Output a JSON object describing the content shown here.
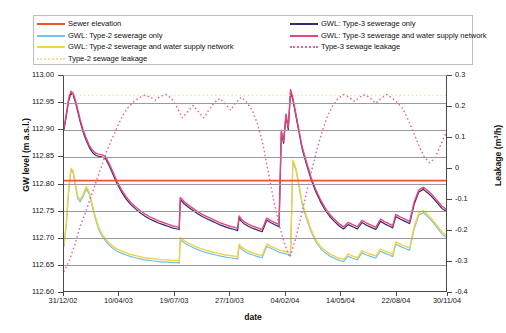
{
  "legend": {
    "items": [
      {
        "label": "Sewer elevation",
        "color": "#E8562A",
        "style": "solid",
        "column": "left"
      },
      {
        "label": "GWL: Type-2 sewerage only",
        "color": "#6FC3EC",
        "style": "solid",
        "column": "left"
      },
      {
        "label": "GWL: Type-2 sewerage and water supply network",
        "color": "#F5D33F",
        "style": "solid",
        "column": "left"
      },
      {
        "label": "Type-2 sewage leakage",
        "color": "#F2E2A0",
        "style": "dotted",
        "column": "left"
      },
      {
        "label": "GWL: Type-3 sewerage only",
        "color": "#2B2B6E",
        "style": "solid",
        "column": "right"
      },
      {
        "label": "GWL: Type-3 sewerage and water supply network",
        "color": "#E8457B",
        "style": "solid",
        "column": "right"
      },
      {
        "label": "Type-3 sewage leakage",
        "color": "#E8629B",
        "style": "dotted",
        "column": "right"
      }
    ]
  },
  "chart_data": {
    "type": "line",
    "title": "",
    "xlabel": "date",
    "ylabel": "GW level (m a.s.l.)",
    "y2label": "Leakage (m³/h)",
    "grid": true,
    "legend_position": "top",
    "x_tick_labels": [
      "31/12/02",
      "10/04/03",
      "19/07/03",
      "27/10/03",
      "04/02/04",
      "14/05/04",
      "22/08/04",
      "30/11/04"
    ],
    "x_tick_fractions": [
      0.0,
      0.1445,
      0.289,
      0.4335,
      0.578,
      0.7225,
      0.867,
      1.0
    ],
    "ylim": [
      112.6,
      113.0
    ],
    "y_tick_labels": [
      "113.00",
      "112.95",
      "112.90",
      "112.85",
      "112.80",
      "112.75",
      "112.70",
      "112.65",
      "112.60"
    ],
    "y_tick_values": [
      113.0,
      112.95,
      112.9,
      112.85,
      112.8,
      112.75,
      112.7,
      112.65,
      112.6
    ],
    "y2lim": [
      -0.4,
      0.3
    ],
    "y2_tick_labels": [
      "0.3",
      "0.2",
      "0.1",
      "0",
      "-0.1",
      "-0.2",
      "-0.3",
      "-0.4"
    ],
    "y2_tick_values": [
      0.3,
      0.2,
      0.1,
      0.0,
      -0.1,
      -0.2,
      -0.3,
      -0.4
    ],
    "series": [
      {
        "name": "Sewer elevation",
        "axis": "left",
        "color": "#E8562A",
        "style": "solid",
        "width": 1.8,
        "x": [
          0,
          1
        ],
        "values": [
          112.807,
          112.807
        ]
      },
      {
        "name": "GWL: Type-3 sewerage and water supply network",
        "axis": "left",
        "color": "#E8457B",
        "style": "solid",
        "width": 1.4,
        "x": [
          0.0,
          0.006,
          0.012,
          0.018,
          0.024,
          0.03,
          0.036,
          0.042,
          0.05,
          0.058,
          0.066,
          0.074,
          0.082,
          0.09,
          0.098,
          0.108,
          0.118,
          0.128,
          0.138,
          0.15,
          0.162,
          0.174,
          0.186,
          0.198,
          0.21,
          0.222,
          0.234,
          0.246,
          0.258,
          0.27,
          0.282,
          0.294,
          0.3,
          0.303,
          0.312,
          0.324,
          0.336,
          0.348,
          0.36,
          0.372,
          0.384,
          0.396,
          0.408,
          0.42,
          0.432,
          0.444,
          0.452,
          0.456,
          0.462,
          0.47,
          0.48,
          0.492,
          0.504,
          0.516,
          0.528,
          0.54,
          0.552,
          0.56,
          0.566,
          0.572,
          0.578,
          0.584,
          0.59,
          0.596,
          0.604,
          0.612,
          0.62,
          0.632,
          0.644,
          0.656,
          0.668,
          0.68,
          0.692,
          0.704,
          0.716,
          0.728,
          0.74,
          0.752,
          0.764,
          0.776,
          0.788,
          0.8,
          0.812,
          0.824,
          0.836,
          0.848,
          0.856,
          0.864,
          0.876,
          0.888,
          0.9,
          0.912,
          0.924,
          0.936,
          0.948,
          0.96,
          0.972,
          0.984,
          1.0
        ],
        "values": [
          112.905,
          112.93,
          112.958,
          112.972,
          112.968,
          112.955,
          112.938,
          112.92,
          112.9,
          112.885,
          112.872,
          112.863,
          112.858,
          112.856,
          112.855,
          112.852,
          112.838,
          112.822,
          112.806,
          112.79,
          112.777,
          112.767,
          112.759,
          112.752,
          112.746,
          112.741,
          112.737,
          112.733,
          112.73,
          112.727,
          112.724,
          112.722,
          112.721,
          112.776,
          112.769,
          112.762,
          112.756,
          112.75,
          112.745,
          112.741,
          112.737,
          112.733,
          112.729,
          112.726,
          112.723,
          112.721,
          112.719,
          112.742,
          112.736,
          112.731,
          112.727,
          112.723,
          112.72,
          112.717,
          112.738,
          112.733,
          112.729,
          112.726,
          112.9,
          112.88,
          112.93,
          112.905,
          112.975,
          112.96,
          112.93,
          112.9,
          112.87,
          112.84,
          112.812,
          112.79,
          112.772,
          112.757,
          112.745,
          112.736,
          112.728,
          112.722,
          112.73,
          112.726,
          112.722,
          112.734,
          112.729,
          112.725,
          112.721,
          112.736,
          112.731,
          112.727,
          112.724,
          112.745,
          112.74,
          112.736,
          112.732,
          112.768,
          112.79,
          112.795,
          112.788,
          112.78,
          112.77,
          112.76,
          112.752
        ]
      },
      {
        "name": "GWL: Type-3 sewerage only",
        "axis": "left",
        "color": "#2B2B6E",
        "style": "solid",
        "width": 1.2,
        "note": "nearly coincident with Type-3 with water supply network, drawn 0.002 m lower"
      },
      {
        "name": "GWL: Type-2 sewerage and water supply network",
        "axis": "left",
        "color": "#F5D33F",
        "style": "solid",
        "width": 1.4,
        "x": [
          0.0,
          0.006,
          0.012,
          0.018,
          0.024,
          0.03,
          0.036,
          0.042,
          0.05,
          0.058,
          0.066,
          0.074,
          0.082,
          0.09,
          0.098,
          0.108,
          0.118,
          0.128,
          0.138,
          0.15,
          0.162,
          0.174,
          0.186,
          0.198,
          0.21,
          0.222,
          0.234,
          0.246,
          0.258,
          0.27,
          0.282,
          0.294,
          0.3,
          0.303,
          0.312,
          0.324,
          0.336,
          0.348,
          0.36,
          0.372,
          0.384,
          0.396,
          0.408,
          0.42,
          0.432,
          0.444,
          0.452,
          0.456,
          0.462,
          0.47,
          0.48,
          0.492,
          0.504,
          0.516,
          0.528,
          0.54,
          0.552,
          0.56,
          0.566,
          0.572,
          0.578,
          0.584,
          0.59,
          0.596,
          0.604,
          0.612,
          0.62,
          0.632,
          0.644,
          0.656,
          0.668,
          0.68,
          0.692,
          0.704,
          0.716,
          0.728,
          0.74,
          0.752,
          0.764,
          0.776,
          0.788,
          0.8,
          0.812,
          0.824,
          0.836,
          0.848,
          0.856,
          0.864,
          0.876,
          0.888,
          0.9,
          0.912,
          0.924,
          0.936,
          0.948,
          0.96,
          0.972,
          0.984,
          1.0
        ],
        "values": [
          112.69,
          112.73,
          112.79,
          112.83,
          112.825,
          112.8,
          112.778,
          112.772,
          112.782,
          112.796,
          112.786,
          112.762,
          112.74,
          112.722,
          112.71,
          112.7,
          112.692,
          112.686,
          112.681,
          112.677,
          112.674,
          112.671,
          112.669,
          112.667,
          112.665,
          112.664,
          112.663,
          112.662,
          112.661,
          112.661,
          112.66,
          112.66,
          112.659,
          112.702,
          112.697,
          112.692,
          112.688,
          112.684,
          112.681,
          112.678,
          112.676,
          112.674,
          112.672,
          112.67,
          112.669,
          112.668,
          112.667,
          112.69,
          112.685,
          112.681,
          112.677,
          112.674,
          112.671,
          112.669,
          112.69,
          112.686,
          112.682,
          112.679,
          112.678,
          112.677,
          112.676,
          112.675,
          112.674,
          112.845,
          112.83,
          112.8,
          112.768,
          112.74,
          112.716,
          112.698,
          112.686,
          112.678,
          112.672,
          112.668,
          112.664,
          112.662,
          112.672,
          112.668,
          112.665,
          112.678,
          112.674,
          112.671,
          112.668,
          112.681,
          112.677,
          112.674,
          112.671,
          112.694,
          112.69,
          112.686,
          112.683,
          112.722,
          112.748,
          112.752,
          112.744,
          112.735,
          112.724,
          112.713,
          112.704
        ]
      },
      {
        "name": "GWL: Type-2 sewerage only",
        "axis": "left",
        "color": "#6FC3EC",
        "style": "solid",
        "width": 1.2,
        "note": "nearly coincident with Type-2 with water supply network, drawn 0.004 m lower"
      },
      {
        "name": "Type-2 sewage leakage",
        "axis": "right",
        "color": "#F2E2A0",
        "style": "dotted",
        "width": 1.6,
        "x": [
          0,
          1
        ],
        "values": [
          0.238,
          0.238
        ]
      },
      {
        "name": "Type-3 sewage leakage",
        "axis": "right",
        "color": "#E8629B",
        "style": "dotted",
        "width": 1.6,
        "x": [
          0.0,
          0.014,
          0.028,
          0.042,
          0.056,
          0.07,
          0.084,
          0.098,
          0.112,
          0.126,
          0.14,
          0.154,
          0.168,
          0.182,
          0.196,
          0.21,
          0.224,
          0.238,
          0.252,
          0.266,
          0.28,
          0.294,
          0.308,
          0.322,
          0.336,
          0.35,
          0.364,
          0.378,
          0.392,
          0.406,
          0.42,
          0.434,
          0.448,
          0.462,
          0.476,
          0.49,
          0.504,
          0.518,
          0.532,
          0.546,
          0.56,
          0.574,
          0.588,
          0.602,
          0.616,
          0.63,
          0.644,
          0.658,
          0.672,
          0.686,
          0.7,
          0.714,
          0.728,
          0.742,
          0.756,
          0.77,
          0.784,
          0.798,
          0.812,
          0.826,
          0.84,
          0.854,
          0.868,
          0.882,
          0.896,
          0.91,
          0.924,
          0.938,
          0.952,
          0.966,
          0.98,
          1.0
        ],
        "values": [
          -0.33,
          -0.295,
          -0.245,
          -0.185,
          -0.14,
          -0.09,
          -0.04,
          0.01,
          0.06,
          0.1,
          0.14,
          0.175,
          0.2,
          0.218,
          0.23,
          0.238,
          0.232,
          0.222,
          0.235,
          0.24,
          0.228,
          0.2,
          0.165,
          0.185,
          0.205,
          0.185,
          0.165,
          0.192,
          0.215,
          0.228,
          0.21,
          0.19,
          0.215,
          0.232,
          0.215,
          0.19,
          0.145,
          0.08,
          -0.01,
          -0.1,
          -0.18,
          -0.24,
          -0.285,
          -0.23,
          -0.16,
          -0.085,
          -0.01,
          0.06,
          0.12,
          0.17,
          0.205,
          0.228,
          0.24,
          0.232,
          0.218,
          0.232,
          0.24,
          0.228,
          0.212,
          0.228,
          0.24,
          0.23,
          0.215,
          0.195,
          0.16,
          0.12,
          0.075,
          0.04,
          0.02,
          0.035,
          0.075,
          0.13
        ]
      }
    ]
  }
}
